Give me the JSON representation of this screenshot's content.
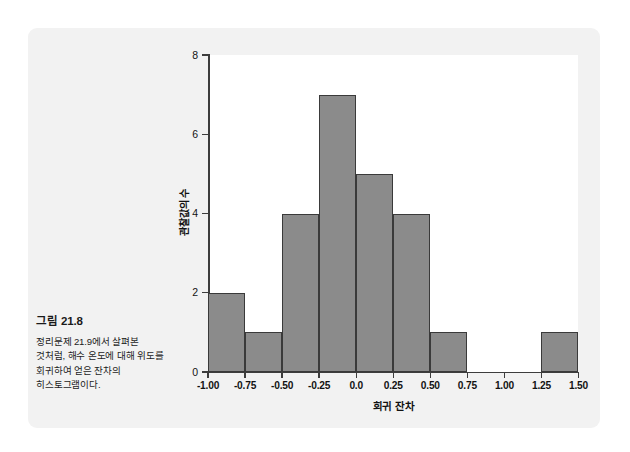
{
  "figure": {
    "caption_title": "그림 21.8",
    "caption_body": "정리문제 21.9에서 살펴본 것처럼, 해수 온도에 대해 위도를 회귀하여 얻은 잔차의 히스토그램이다.",
    "panel_background": "#f2f2f2",
    "plot_background": "#ffffff",
    "bar_fill": "#8b8b8b",
    "bar_stroke": "#3a3a3a",
    "axis_color": "#3d3d3d"
  },
  "chart_data": {
    "type": "bar",
    "title": "",
    "subtitle": "",
    "xlabel": "회귀 잔차",
    "ylabel": "관찰값의 수",
    "xlim": [
      -1.0,
      1.5
    ],
    "ylim": [
      0,
      8
    ],
    "grid": false,
    "legend": "none",
    "bin_width": 0.25,
    "xticks": [
      "-1.00",
      "-0.75",
      "-0.50",
      "-0.25",
      "0.0",
      "0.25",
      "0.50",
      "0.75",
      "1.00",
      "1.25",
      "1.50"
    ],
    "xtick_values": [
      -1.0,
      -0.75,
      -0.5,
      -0.25,
      0.0,
      0.25,
      0.5,
      0.75,
      1.0,
      1.25,
      1.5
    ],
    "yticks": [
      "0",
      "2",
      "4",
      "6",
      "8"
    ],
    "ytick_values": [
      0,
      2,
      4,
      6,
      8
    ],
    "categories": [
      "-1.00 to -0.75",
      "-0.75 to -0.50",
      "-0.50 to -0.25",
      "-0.25 to 0.00",
      "0.00 to 0.25",
      "0.25 to 0.50",
      "0.50 to 0.75",
      "0.75 to 1.00",
      "1.00 to 1.25",
      "1.25 to 1.50"
    ],
    "bin_edges": [
      -1.0,
      -0.75,
      -0.5,
      -0.25,
      0.0,
      0.25,
      0.5,
      0.75,
      1.0,
      1.25,
      1.5
    ],
    "values": [
      2,
      1,
      4,
      7,
      5,
      4,
      1,
      0,
      0,
      1
    ]
  }
}
